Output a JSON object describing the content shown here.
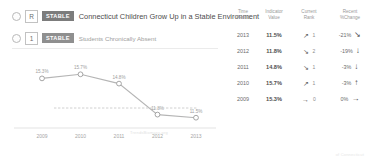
{
  "rows": [
    {
      "bullet": "radio-bullet",
      "key": "R",
      "badge": "STABLE",
      "title": "Connecticut Children Grow Up in a Stable Environment"
    },
    {
      "bullet": "radio-bullet",
      "key": "1",
      "badge": "STABLE",
      "title": "Students Chronically Absent"
    }
  ],
  "watermark": "TrendsBiomass.org",
  "footer": "of Connecticut",
  "table": {
    "headers": [
      {
        "line1": "Time",
        "line2": "Period"
      },
      {
        "line1": "Indicator",
        "line2": "Value"
      },
      {
        "line1": "Current",
        "line2": "Rank"
      },
      {
        "line1": "Recent",
        "line2": "%Change"
      }
    ],
    "rows": [
      {
        "period": "2013",
        "value": "11.5%",
        "rank_arrow": "↗",
        "rank": "1",
        "change": "-21%",
        "change_arrow": "↘"
      },
      {
        "period": "2012",
        "value": "11.8%",
        "rank_arrow": "↘",
        "rank": "2",
        "change": "-19%",
        "change_arrow": "↓"
      },
      {
        "period": "2011",
        "value": "14.8%",
        "rank_arrow": "↘",
        "rank": "1",
        "change": "-3%",
        "change_arrow": "↓"
      },
      {
        "period": "2010",
        "value": "15.7%",
        "rank_arrow": "↗",
        "rank": "1",
        "change": "-3%",
        "change_arrow": "↑"
      },
      {
        "period": "2009",
        "value": "15.3%",
        "rank_arrow": "→",
        "rank": "0",
        "change": "0%",
        "change_arrow": "→"
      }
    ]
  },
  "chart_data": {
    "type": "line",
    "title": "",
    "xlabel": "",
    "ylabel": "",
    "categories": [
      "2009",
      "2010",
      "2011",
      "2012",
      "2013"
    ],
    "values": [
      15.3,
      15.7,
      14.8,
      11.8,
      11.5
    ],
    "point_labels": [
      "15.3%",
      "15.7%",
      "14.8%",
      "11.8%",
      "11.5%"
    ],
    "ylim": [
      10.5,
      16.5
    ],
    "grid": false,
    "legend": "none",
    "line_color": "#b5b5b5",
    "marker_color": "#ffffff",
    "marker_border": "#9b9b9b",
    "reference_line_style": "dashed",
    "reference_line_color": "#c9c9c9"
  }
}
